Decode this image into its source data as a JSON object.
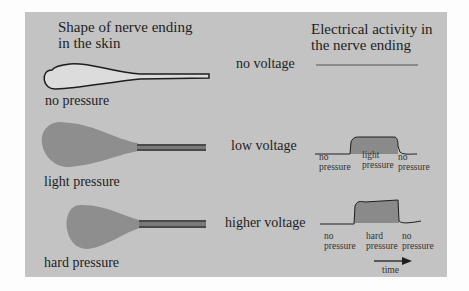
{
  "headers": {
    "left_line1": "Shape of nerve ending",
    "left_line2": "in the skin",
    "right_line1": "Electrical activity in",
    "right_line2": "the nerve ending"
  },
  "rows": [
    {
      "shape_label": "no pressure",
      "voltage_label": "no voltage",
      "trace_labels": []
    },
    {
      "shape_label": "light pressure",
      "voltage_label": "low voltage",
      "trace_labels": [
        "no\npressure",
        "light\npressure",
        "no\npressure"
      ]
    },
    {
      "shape_label": "hard pressure",
      "voltage_label": "higher voltage",
      "trace_labels": [
        "no\npressure",
        "hard\npressure",
        "no\npressure"
      ]
    }
  ],
  "time_axis": {
    "label": "time"
  },
  "colors": {
    "background": "#c3c3c3",
    "nerve_unpressed_fill": "#dcdcdc",
    "nerve_pressed_fill": "#8e8e8e",
    "nerve_axon_dark": "#4a4a4a",
    "trace_fill": "#8a8a8a",
    "line": "#1e1e1e"
  }
}
